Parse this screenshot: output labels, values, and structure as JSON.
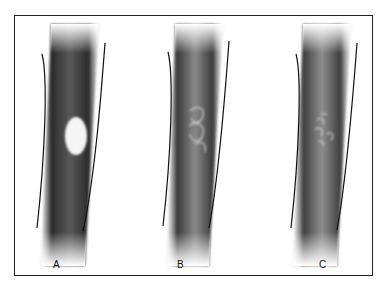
{
  "figure": {
    "panels": [
      {
        "id": "A",
        "label": "A",
        "lesion": "well-defined lytic (radiolucent) oval lesion"
      },
      {
        "id": "B",
        "label": "B",
        "lesion": "partially marginated lytic area with sclerotic rim fragments"
      },
      {
        "id": "C",
        "label": "C",
        "lesion": "ill-defined mottled/moth-eaten lucent areas"
      }
    ],
    "colors": {
      "frame": "#222222",
      "cortex_line": "#111111",
      "bone_dark": "#3a3a3a",
      "bone_mid": "#6e6e6e",
      "lesion": "#f4f4f4"
    }
  }
}
